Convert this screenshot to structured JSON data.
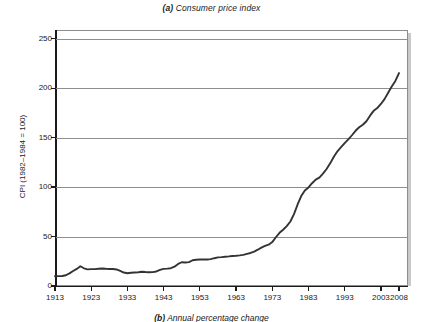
{
  "figure": {
    "panel_a_tag": "(a)",
    "panel_a_title": " Consumer price index",
    "panel_b_tag": "(b)",
    "panel_b_title": " Annual percentage change"
  },
  "chart_data": {
    "type": "line",
    "title": "(a) Consumer price index",
    "xlabel": "",
    "ylabel": "CPI (1982–1984 = 100)",
    "xlim": [
      1913,
      2008
    ],
    "ylim": [
      0,
      250
    ],
    "yticks": [
      0,
      50,
      100,
      150,
      200,
      250
    ],
    "ytick_labels": [
      "0",
      "50",
      "100",
      "150",
      "200",
      "250"
    ],
    "xticks": [
      1913,
      1923,
      1933,
      1943,
      1953,
      1963,
      1973,
      1983,
      1993,
      2003,
      2008
    ],
    "xtick_labels": [
      "1913",
      "1923",
      "1933",
      "1943",
      "1953",
      "1963",
      "1973",
      "1983",
      "1993",
      "2003",
      "2008"
    ],
    "grid": "horizontal",
    "legend": "none",
    "line_color": "#333333",
    "series": [
      {
        "name": "CPI (1982-1984 = 100)",
        "x": [
          1913,
          1914,
          1915,
          1916,
          1917,
          1918,
          1919,
          1920,
          1921,
          1922,
          1923,
          1924,
          1925,
          1926,
          1927,
          1928,
          1929,
          1930,
          1931,
          1932,
          1933,
          1934,
          1935,
          1936,
          1937,
          1938,
          1939,
          1940,
          1941,
          1942,
          1943,
          1944,
          1945,
          1946,
          1947,
          1948,
          1949,
          1950,
          1951,
          1952,
          1953,
          1954,
          1955,
          1956,
          1957,
          1958,
          1959,
          1960,
          1961,
          1962,
          1963,
          1964,
          1965,
          1966,
          1967,
          1968,
          1969,
          1970,
          1971,
          1972,
          1973,
          1974,
          1975,
          1976,
          1977,
          1978,
          1979,
          1980,
          1981,
          1982,
          1983,
          1984,
          1985,
          1986,
          1987,
          1988,
          1989,
          1990,
          1991,
          1992,
          1993,
          1994,
          1995,
          1996,
          1997,
          1998,
          1999,
          2000,
          2001,
          2002,
          2003,
          2004,
          2005,
          2006,
          2007,
          2008
        ],
        "y": [
          9.9,
          10.0,
          10.1,
          10.9,
          12.8,
          15.1,
          17.3,
          20.0,
          17.9,
          16.8,
          17.1,
          17.1,
          17.5,
          17.7,
          17.4,
          17.2,
          17.2,
          16.7,
          15.2,
          13.6,
          12.9,
          13.4,
          13.7,
          13.9,
          14.4,
          14.1,
          13.9,
          14.0,
          14.7,
          16.3,
          17.3,
          17.6,
          18.0,
          19.5,
          22.3,
          24.0,
          23.8,
          24.1,
          26.0,
          26.6,
          26.8,
          26.9,
          26.8,
          27.2,
          28.1,
          28.9,
          29.2,
          29.6,
          29.9,
          30.3,
          30.6,
          31.0,
          31.5,
          32.5,
          33.4,
          34.8,
          36.7,
          38.8,
          40.5,
          41.8,
          44.4,
          49.3,
          53.8,
          56.9,
          60.6,
          65.2,
          72.6,
          82.4,
          90.9,
          96.5,
          99.6,
          103.9,
          107.6,
          109.6,
          113.6,
          118.3,
          124.0,
          130.7,
          136.2,
          140.3,
          144.5,
          148.2,
          152.4,
          156.9,
          160.5,
          163.0,
          166.6,
          172.2,
          177.1,
          179.9,
          184.0,
          188.9,
          195.3,
          201.6,
          207.3,
          215.3
        ]
      }
    ]
  }
}
